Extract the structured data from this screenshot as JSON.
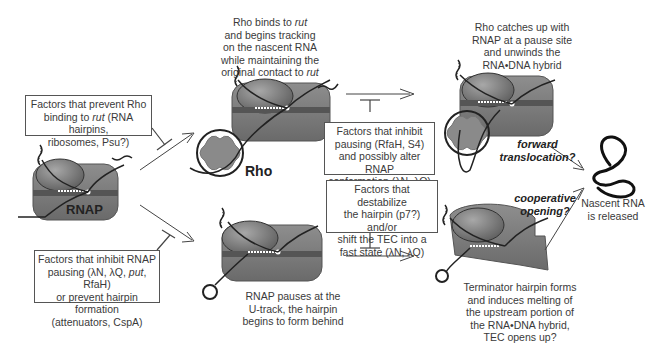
{
  "diagram": {
    "stages": {
      "initial": {
        "label": "RNAP"
      },
      "rho_binding": {
        "caption_parts": [
          "Rho binds to ",
          "rut",
          " and begins tracking on the nascent RNA while maintaining the original contact to ",
          "rut"
        ],
        "caption_line1a": "Rho binds to ",
        "caption_line1b": "rut",
        "caption_line2": "and begins tracking",
        "caption_line3": "on the nascent RNA",
        "caption_line4": "while maintaining the",
        "caption_line5a": "original contact to ",
        "caption_line5b": "rut",
        "rho_label": "Rho"
      },
      "rho_catchup": {
        "caption_line1": "Rho catches up with",
        "caption_line2": "RNAP at a pause site",
        "caption_line3": "and unwinds the",
        "caption_line4": "RNA•DNA hybrid"
      },
      "rnap_pause": {
        "caption_line1": "RNAP pauses at the",
        "caption_line2": "U-track, the hairpin",
        "caption_line3": "begins to form behind"
      },
      "hairpin_forms": {
        "caption_line1": "Terminator hairpin forms",
        "caption_line2": "and induces melting of",
        "caption_line3": "the upstream portion of",
        "caption_line4": "the RNA•DNA hybrid,",
        "caption_line5": "TEC opens up?"
      },
      "released": {
        "caption_line1": "Nascent RNA",
        "caption_line2": "is released"
      }
    },
    "inhibitor_boxes": {
      "prevent_rho": {
        "line1": "Factors that prevent Rho",
        "line2a": "binding to ",
        "line2b": "rut",
        "line2c": " (RNA hairpins,",
        "line3": "ribosomes, Psu?)"
      },
      "inhibit_pausing_rho": {
        "line1": "Factors that inhibit",
        "line2": "pausing (RfaH, S4)",
        "line3": "and possibly alter RNAP",
        "line4": "conformation (λN, λQ)"
      },
      "destabilize_hairpin": {
        "line1": "Factors that destabilize",
        "line2": "the hairpin (p7?) and/or",
        "line3": "shift the TEC into a",
        "line4": "fast state (λN, λQ)"
      },
      "inhibit_rnap_pausing": {
        "line1": "Factors that inhibit RNAP",
        "line2a": "pausing (λN, λQ, ",
        "line2b": "put",
        "line2c": ", RfaH)",
        "line3": "or prevent hairpin formation",
        "line4": "(attenuators, CspA)"
      }
    },
    "mechanisms": {
      "forward_line1": "forward",
      "forward_line2": "translocation?",
      "cooperative_line1": "cooperative",
      "cooperative_line2": "opening?"
    },
    "colors": {
      "rnap_body": "#7a7a7a",
      "rnap_dark": "#5a5a5a",
      "rho": "#8a8a8a",
      "line": "#222222",
      "box_border": "#555555"
    }
  }
}
